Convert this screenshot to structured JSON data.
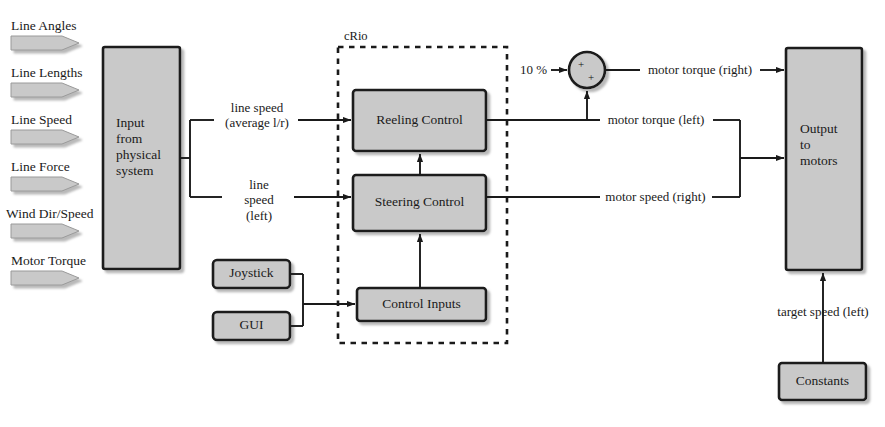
{
  "diagram": {
    "colors": {
      "block_fill": "#c9c9c9",
      "block_stroke": "#1a1a1a",
      "line": "#1a1a1a",
      "background": "#ffffff",
      "shadow": "#bfbfbf"
    },
    "inputs": [
      {
        "label": "Line Angles"
      },
      {
        "label": "Line Lengths"
      },
      {
        "label": "Line Speed"
      },
      {
        "label": "Line Force"
      },
      {
        "label": "Wind Dir/Speed"
      },
      {
        "label": "Motor Torque"
      }
    ],
    "blocks": {
      "input_from_physical_system": {
        "lines": [
          "Input",
          "from",
          "physical",
          "system"
        ]
      },
      "reeling_control": {
        "label": "Reeling Control"
      },
      "steering_control": {
        "label": "Steering Control"
      },
      "control_inputs": {
        "label": "Control Inputs"
      },
      "joystick": {
        "label": "Joystick"
      },
      "gui": {
        "label": "GUI"
      },
      "output_to_motors": {
        "lines": [
          "Output",
          "to",
          "motors"
        ]
      },
      "constants": {
        "label": "Constants"
      }
    },
    "container": {
      "crio_label": "cRio"
    },
    "summing_junction": {
      "gain_label": "10 %",
      "sign_left": "+",
      "sign_bottom": "+"
    },
    "signals": {
      "line_speed_avg": {
        "lines": [
          "line speed",
          "(average l/r)"
        ]
      },
      "line_speed_left": {
        "lines": [
          "line",
          "speed",
          "(left)"
        ]
      },
      "motor_torque_right": {
        "label": "motor torque (right)"
      },
      "motor_torque_left": {
        "label": "motor torque (left)"
      },
      "motor_speed_right": {
        "label": "motor speed (right)"
      },
      "target_speed_left": {
        "label": "target speed (left)"
      }
    }
  }
}
